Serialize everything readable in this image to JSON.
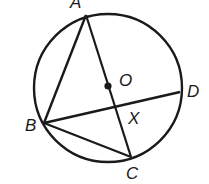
{
  "diagram": {
    "type": "geometry-circle",
    "stroke_color": "#1a1a1a",
    "background": "#ffffff",
    "circle": {
      "center": "O",
      "cx": 108,
      "cy": 88,
      "r": 74
    },
    "points": {
      "A": {
        "label": "A",
        "x": 86,
        "y": 15,
        "lx": 70,
        "ly": 8
      },
      "B": {
        "label": "B",
        "x": 44,
        "y": 123,
        "lx": 25,
        "ly": 130
      },
      "C": {
        "label": "C",
        "x": 131,
        "y": 157,
        "lx": 126,
        "ly": 179
      },
      "D": {
        "label": "D",
        "x": 180,
        "y": 92,
        "lx": 187,
        "ly": 97
      },
      "O": {
        "label": "O",
        "x": 108,
        "y": 86,
        "lx": 119,
        "ly": 85
      },
      "X": {
        "label": "X",
        "x": 115,
        "y": 105,
        "lx": 128,
        "ly": 124
      }
    },
    "segments": [
      {
        "from": "A",
        "to": "B"
      },
      {
        "from": "A",
        "to": "C"
      },
      {
        "from": "B",
        "to": "C"
      },
      {
        "from": "B",
        "to": "D"
      }
    ]
  }
}
